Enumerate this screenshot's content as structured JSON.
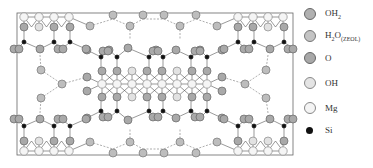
{
  "figure": {
    "frame": {
      "x": 17,
      "y": 13,
      "width": 276,
      "height": 142
    }
  },
  "legend": {
    "items": [
      {
        "key": "OH2",
        "label_main": "OH",
        "label_sub": "2",
        "sub_style": "sub",
        "fill": "#b0b0b0",
        "stroke": "#666666",
        "size": "large",
        "y": 14
      },
      {
        "key": "H2O_ZEOL",
        "label_main": "H",
        "label_sub": "2",
        "label_after": "O",
        "label_sub2": "(ZEOL)",
        "fill": "#c4c4c4",
        "stroke": "#777777",
        "size": "large",
        "y": 36
      },
      {
        "key": "O",
        "label_main": "O",
        "fill": "#a8a8a8",
        "stroke": "#666666",
        "size": "large",
        "y": 58
      },
      {
        "key": "OH",
        "label_main": "OH",
        "fill": "#e4e4e4",
        "stroke": "#888888",
        "size": "large",
        "y": 83
      },
      {
        "key": "Mg",
        "label_main": "Mg",
        "fill": "#f4f4f4",
        "stroke": "#888888",
        "size": "large",
        "y": 108
      },
      {
        "key": "Si",
        "label_main": "Si",
        "fill": "#111111",
        "stroke": "#111111",
        "size": "small",
        "y": 131
      }
    ]
  },
  "colors": {
    "oxygen": "#a9a9a9",
    "water": "#bdbdbd",
    "hydroxyl": "#e2e2e2",
    "magnesium": "#f5f5f5",
    "silicon": "#111111",
    "bond": "#555555",
    "hbond": "#777777",
    "frame": "#666666"
  }
}
